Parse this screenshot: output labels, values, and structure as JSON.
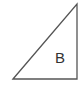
{
  "diagram": {
    "shape": "right-triangle",
    "label": "B",
    "stroke_color": "#555555"
  }
}
